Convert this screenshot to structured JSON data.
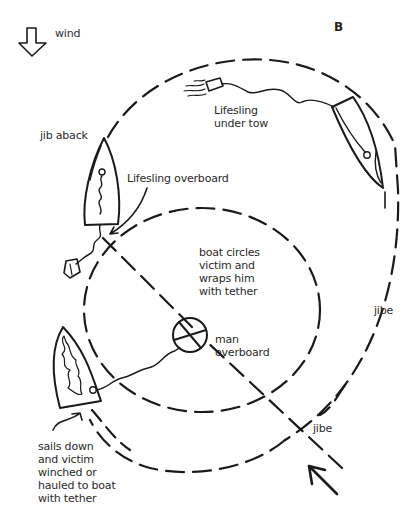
{
  "diagram": {
    "panel_label": "B",
    "wind": {
      "label": "wind",
      "icon": "down-arrow-outline-icon"
    },
    "labels": {
      "jib_aback": "jib aback",
      "lifesling_overboard": "Lifesling overboard",
      "lifesling_under_tow": "Lifesling\nunder tow",
      "boat_circles": "boat circles\nvictim and\nwraps him\nwith tether",
      "man_overboard": "man\noverboard",
      "jibe_right": "jibe",
      "jibe_bottom": "jibe",
      "sails_down": "sails down\nand victim\nwinched or\nhauled to boat\nwith tether"
    },
    "colors": {
      "ink": "#1a1a1a",
      "text": "#2a2a2a",
      "background": "#ffffff"
    }
  }
}
